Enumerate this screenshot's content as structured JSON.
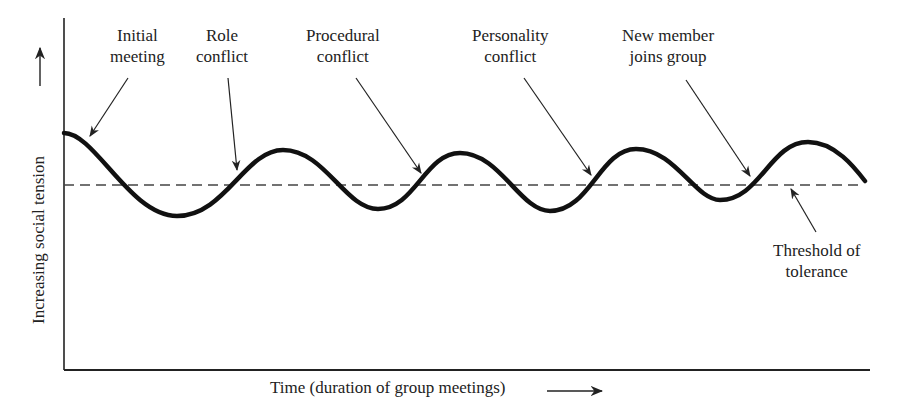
{
  "diagram": {
    "y_axis_label": "Increasing social tension",
    "x_axis_label": "Time (duration of group meetings)",
    "threshold_label": {
      "line1": "Threshold of",
      "line2": "tolerance"
    },
    "annotations": [
      {
        "id": "initial-meeting",
        "line1": "Initial",
        "line2": "meeting"
      },
      {
        "id": "role-conflict",
        "line1": "Role",
        "line2": "conflict"
      },
      {
        "id": "procedural-conflict",
        "line1": "Procedural",
        "line2": "conflict"
      },
      {
        "id": "personality-conflict",
        "line1": "Personality",
        "line2": "conflict"
      },
      {
        "id": "new-member",
        "line1": "New member",
        "line2": "joins group"
      }
    ],
    "colors": {
      "curve": "#111111",
      "threshold": "#444444",
      "axis": "#222222",
      "text": "#222222"
    }
  }
}
